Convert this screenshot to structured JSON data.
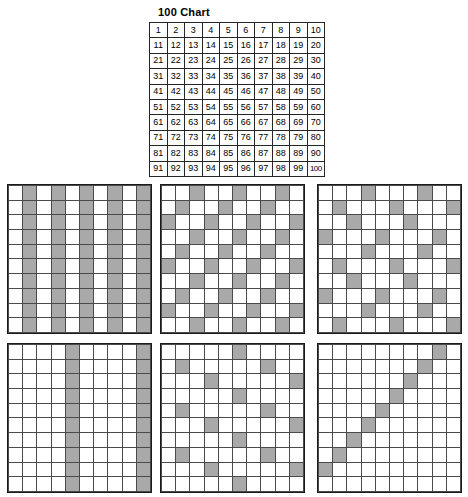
{
  "page": {
    "title": "100 Chart",
    "background_color": "#ffffff",
    "shade_color": "#a9a9a9",
    "line_color": "#4a4a4a",
    "border_color": "#1a1a1a"
  },
  "chart_data": {
    "type": "table",
    "title": "100 Chart",
    "rows": 10,
    "columns": 10,
    "values": [
      [
        1,
        2,
        3,
        4,
        5,
        6,
        7,
        8,
        9,
        10
      ],
      [
        11,
        12,
        13,
        14,
        15,
        16,
        17,
        18,
        19,
        20
      ],
      [
        21,
        22,
        23,
        24,
        25,
        26,
        27,
        28,
        29,
        30
      ],
      [
        31,
        32,
        33,
        34,
        35,
        36,
        37,
        38,
        39,
        40
      ],
      [
        41,
        42,
        43,
        44,
        45,
        46,
        47,
        48,
        49,
        50
      ],
      [
        51,
        52,
        53,
        54,
        55,
        56,
        57,
        58,
        59,
        60
      ],
      [
        61,
        62,
        63,
        64,
        65,
        66,
        67,
        68,
        69,
        70
      ],
      [
        71,
        72,
        73,
        74,
        75,
        76,
        77,
        78,
        79,
        80
      ],
      [
        81,
        82,
        83,
        84,
        85,
        86,
        87,
        88,
        89,
        90
      ],
      [
        91,
        92,
        93,
        94,
        95,
        96,
        97,
        98,
        99,
        100
      ]
    ]
  },
  "grids": [
    {
      "name": "multiples-of-2",
      "position": "top-left",
      "rows": 10,
      "columns": 10,
      "multiple": 2,
      "shaded": [
        [
          0,
          1,
          0,
          1,
          0,
          1,
          0,
          1,
          0,
          1
        ],
        [
          0,
          1,
          0,
          1,
          0,
          1,
          0,
          1,
          0,
          1
        ],
        [
          0,
          1,
          0,
          1,
          0,
          1,
          0,
          1,
          0,
          1
        ],
        [
          0,
          1,
          0,
          1,
          0,
          1,
          0,
          1,
          0,
          1
        ],
        [
          0,
          1,
          0,
          1,
          0,
          1,
          0,
          1,
          0,
          1
        ],
        [
          0,
          1,
          0,
          1,
          0,
          1,
          0,
          1,
          0,
          1
        ],
        [
          0,
          1,
          0,
          1,
          0,
          1,
          0,
          1,
          0,
          1
        ],
        [
          0,
          1,
          0,
          1,
          0,
          1,
          0,
          1,
          0,
          1
        ],
        [
          0,
          1,
          0,
          1,
          0,
          1,
          0,
          1,
          0,
          1
        ],
        [
          0,
          1,
          0,
          1,
          0,
          1,
          0,
          1,
          0,
          1
        ]
      ]
    },
    {
      "name": "multiples-of-3",
      "position": "top-middle",
      "rows": 10,
      "columns": 10,
      "multiple": 3,
      "shaded": [
        [
          0,
          0,
          1,
          0,
          0,
          1,
          0,
          0,
          1,
          0
        ],
        [
          0,
          1,
          0,
          0,
          1,
          0,
          0,
          1,
          0,
          0
        ],
        [
          1,
          0,
          0,
          1,
          0,
          0,
          1,
          0,
          0,
          1
        ],
        [
          0,
          0,
          1,
          0,
          0,
          1,
          0,
          0,
          1,
          0
        ],
        [
          0,
          1,
          0,
          0,
          1,
          0,
          0,
          1,
          0,
          0
        ],
        [
          1,
          0,
          0,
          1,
          0,
          0,
          1,
          0,
          0,
          1
        ],
        [
          0,
          0,
          1,
          0,
          0,
          1,
          0,
          0,
          1,
          0
        ],
        [
          0,
          1,
          0,
          0,
          1,
          0,
          0,
          1,
          0,
          0
        ],
        [
          1,
          0,
          0,
          1,
          0,
          0,
          1,
          0,
          0,
          1
        ],
        [
          0,
          0,
          1,
          0,
          0,
          1,
          0,
          0,
          1,
          0
        ]
      ]
    },
    {
      "name": "multiples-of-4",
      "position": "top-right",
      "rows": 10,
      "columns": 10,
      "multiple": 4,
      "shaded": [
        [
          0,
          0,
          0,
          1,
          0,
          0,
          0,
          1,
          0,
          0
        ],
        [
          0,
          1,
          0,
          0,
          0,
          1,
          0,
          0,
          0,
          1
        ],
        [
          0,
          0,
          1,
          0,
          0,
          0,
          1,
          0,
          0,
          0
        ],
        [
          1,
          0,
          0,
          0,
          1,
          0,
          0,
          0,
          1,
          0
        ],
        [
          0,
          0,
          0,
          1,
          0,
          0,
          0,
          1,
          0,
          0
        ],
        [
          0,
          1,
          0,
          0,
          0,
          1,
          0,
          0,
          0,
          1
        ],
        [
          0,
          0,
          1,
          0,
          0,
          0,
          1,
          0,
          0,
          0
        ],
        [
          1,
          0,
          0,
          0,
          1,
          0,
          0,
          0,
          1,
          0
        ],
        [
          0,
          0,
          0,
          1,
          0,
          0,
          0,
          1,
          0,
          0
        ],
        [
          0,
          1,
          0,
          0,
          0,
          1,
          0,
          0,
          0,
          1
        ]
      ]
    },
    {
      "name": "multiples-of-5",
      "position": "bottom-left",
      "rows": 10,
      "columns": 10,
      "multiple": 5,
      "shaded": [
        [
          0,
          0,
          0,
          0,
          1,
          0,
          0,
          0,
          0,
          1
        ],
        [
          0,
          0,
          0,
          0,
          1,
          0,
          0,
          0,
          0,
          1
        ],
        [
          0,
          0,
          0,
          0,
          1,
          0,
          0,
          0,
          0,
          1
        ],
        [
          0,
          0,
          0,
          0,
          1,
          0,
          0,
          0,
          0,
          1
        ],
        [
          0,
          0,
          0,
          0,
          1,
          0,
          0,
          0,
          0,
          1
        ],
        [
          0,
          0,
          0,
          0,
          1,
          0,
          0,
          0,
          0,
          1
        ],
        [
          0,
          0,
          0,
          0,
          1,
          0,
          0,
          0,
          0,
          1
        ],
        [
          0,
          0,
          0,
          0,
          1,
          0,
          0,
          0,
          0,
          1
        ],
        [
          0,
          0,
          0,
          0,
          1,
          0,
          0,
          0,
          0,
          1
        ],
        [
          0,
          0,
          0,
          0,
          1,
          0,
          0,
          0,
          0,
          1
        ]
      ]
    },
    {
      "name": "multiples-of-6",
      "position": "bottom-middle",
      "rows": 10,
      "columns": 10,
      "multiple": 6,
      "shaded": [
        [
          0,
          0,
          0,
          0,
          0,
          1,
          0,
          0,
          0,
          0
        ],
        [
          0,
          1,
          0,
          0,
          0,
          0,
          0,
          1,
          0,
          0
        ],
        [
          0,
          0,
          0,
          1,
          0,
          0,
          0,
          0,
          0,
          1
        ],
        [
          0,
          0,
          0,
          0,
          0,
          1,
          0,
          0,
          0,
          0
        ],
        [
          0,
          1,
          0,
          0,
          0,
          0,
          0,
          1,
          0,
          0
        ],
        [
          0,
          0,
          0,
          1,
          0,
          0,
          0,
          0,
          0,
          1
        ],
        [
          0,
          0,
          0,
          0,
          0,
          1,
          0,
          0,
          0,
          0
        ],
        [
          0,
          1,
          0,
          0,
          0,
          0,
          0,
          1,
          0,
          0
        ],
        [
          0,
          0,
          0,
          1,
          0,
          0,
          0,
          0,
          0,
          1
        ],
        [
          0,
          0,
          0,
          0,
          0,
          1,
          0,
          0,
          0,
          0
        ]
      ]
    },
    {
      "name": "multiples-of-11",
      "position": "bottom-right",
      "rows": 10,
      "columns": 10,
      "multiple": 11,
      "shaded": [
        [
          0,
          0,
          0,
          0,
          0,
          0,
          0,
          0,
          1,
          0
        ],
        [
          0,
          0,
          0,
          0,
          0,
          0,
          0,
          1,
          0,
          0
        ],
        [
          0,
          0,
          0,
          0,
          0,
          0,
          1,
          0,
          0,
          0
        ],
        [
          0,
          0,
          0,
          0,
          0,
          1,
          0,
          0,
          0,
          0
        ],
        [
          0,
          0,
          0,
          0,
          1,
          0,
          0,
          0,
          0,
          0
        ],
        [
          0,
          0,
          0,
          1,
          0,
          0,
          0,
          0,
          0,
          0
        ],
        [
          0,
          0,
          1,
          0,
          0,
          0,
          0,
          0,
          0,
          0
        ],
        [
          0,
          1,
          0,
          0,
          0,
          0,
          0,
          0,
          0,
          0
        ],
        [
          1,
          0,
          0,
          0,
          0,
          0,
          0,
          0,
          0,
          0
        ],
        [
          0,
          0,
          0,
          0,
          0,
          0,
          0,
          0,
          0,
          0
        ]
      ]
    }
  ]
}
